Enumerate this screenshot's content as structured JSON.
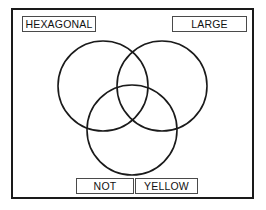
{
  "figure": {
    "type": "venn-diagram-3-set",
    "title": "",
    "frame": {
      "border_color": "#1a1a1a",
      "background": "#ffffff"
    },
    "stroke_color": "#1a1a1a",
    "background": "#ffffff"
  },
  "labels": {
    "top_left": "HEXAGONAL",
    "top_right": "LARGE",
    "bottom_left": "NOT",
    "bottom_right": "YELLOW"
  },
  "circles": [
    {
      "name": "upper-left-circle",
      "cx": 103,
      "cy": 86,
      "r": 45
    },
    {
      "name": "upper-right-circle",
      "cx": 162,
      "cy": 86,
      "r": 45
    },
    {
      "name": "lower-center-circle",
      "cx": 132,
      "cy": 130,
      "r": 45
    }
  ]
}
